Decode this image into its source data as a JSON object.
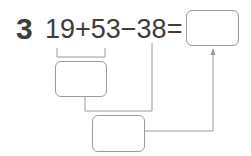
{
  "problem": {
    "number": "3",
    "expression": "19+53−38=",
    "answer_box": {
      "value": ""
    },
    "step1_box": {
      "value": ""
    },
    "step2_box": {
      "value": ""
    }
  },
  "colors": {
    "text": "#3c3c3c",
    "lines": "#9a9a9a"
  }
}
